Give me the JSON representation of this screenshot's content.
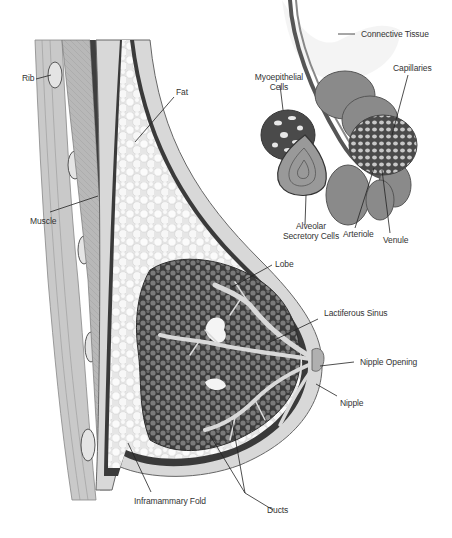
{
  "diagram": {
    "main_labels": {
      "rib": "Rib",
      "fat": "Fat",
      "muscle": "Muscle",
      "lobe": "Lobe",
      "lactiferous_sinus": "Lactiferous Sinus",
      "nipple_opening": "Nipple Opening",
      "nipple": "Nipple",
      "inframammary_fold": "Inframammary Fold",
      "ducts": "Ducts"
    },
    "inset_labels": {
      "connective_tissue": "Connective Tissue",
      "myoepithelial_cells_1": "Myoepithelial",
      "myoepithelial_cells_2": "Cells",
      "capillaries": "Capillaries",
      "alveolar_1": "Alveolar",
      "alveolar_2": "Secretory Cells",
      "arteriole": "Arteriole",
      "venule": "Venule"
    },
    "colors": {
      "skin": "#dcdcdc",
      "fat": "#f2f2f2",
      "tissue_dark": "#4a4a4a",
      "muscle": "#9a9a9a",
      "line": "#222222"
    }
  }
}
